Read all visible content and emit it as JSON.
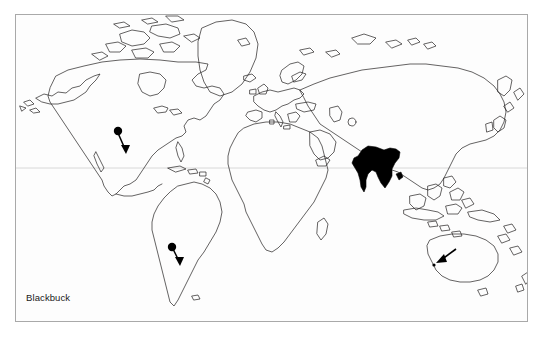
{
  "figure": {
    "caption": "Blackbuck",
    "type": "distribution-map",
    "projection": "world"
  },
  "colors": {
    "background": "#ffffff",
    "map_background": "#fdfdfd",
    "frame_border": "#a9a9a9",
    "coastline": "#231f20",
    "range_fill": "#000000",
    "equator_line": "#d8d8d8",
    "caption_text": "#1a1a1a",
    "marker": "#000000"
  },
  "frame": {
    "x": 15,
    "y": 14,
    "width": 513,
    "height": 308
  },
  "map_data": {
    "equator": {
      "y": 168,
      "label": ""
    },
    "native_range": [
      {
        "name": "India",
        "region": "South Asia",
        "style": "solid-fill",
        "fill": "#000000"
      }
    ],
    "introduced_markers": [
      {
        "name": "North America",
        "location": "Texas, United States",
        "style": "ball-and-arrow",
        "dot": {
          "x": 118,
          "y": 131
        },
        "tip": {
          "x": 126,
          "y": 153
        }
      },
      {
        "name": "South America",
        "location": "Argentina",
        "style": "ball-and-arrow",
        "dot": {
          "x": 172,
          "y": 247
        },
        "tip": {
          "x": 180,
          "y": 265
        }
      },
      {
        "name": "Australia",
        "location": "Western Australia",
        "style": "arrow",
        "dot": {
          "x": 435,
          "y": 263
        },
        "tip": {
          "x": 437,
          "y": 262
        },
        "tail": {
          "x": 456,
          "y": 249
        }
      }
    ]
  }
}
